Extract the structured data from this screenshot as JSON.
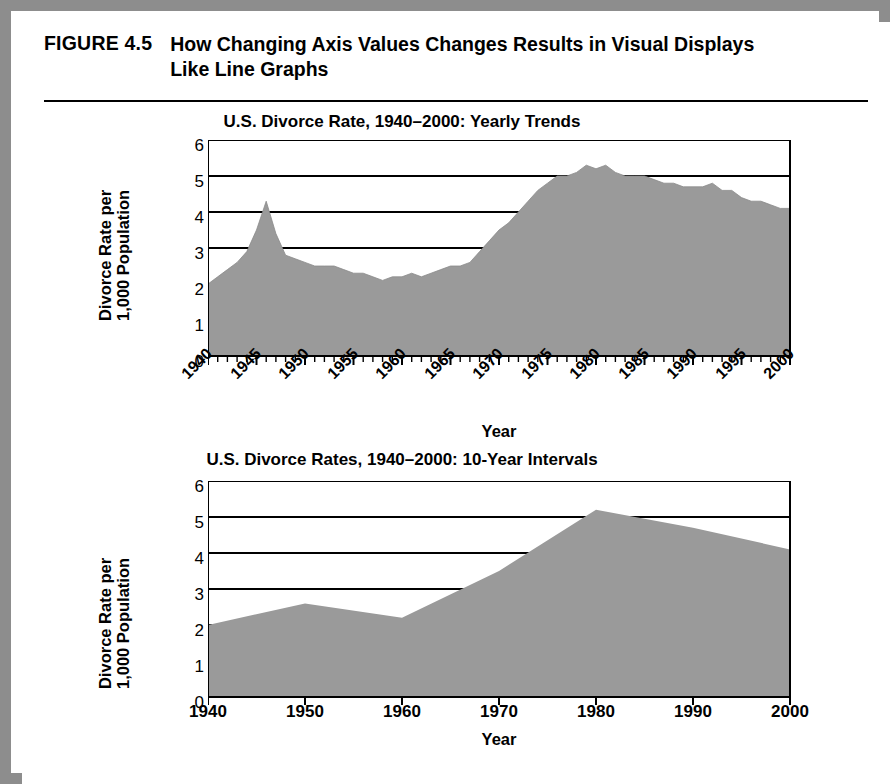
{
  "figure": {
    "number": "FIGURE 4.5",
    "title": "How Changing Axis Values Changes Results in Visual Displays Like Line Graphs"
  },
  "charts": [
    {
      "id": "yearly-trends",
      "title": "U.S. Divorce Rate, 1940–2000: Yearly Trends",
      "ylabel_line1": "Divorce Rate per",
      "ylabel_line2": "1,000 Population",
      "xlabel": "Year",
      "yticks": [
        "6",
        "5",
        "4",
        "3",
        "2",
        "1",
        "0"
      ],
      "xticks": [
        "1940",
        "1945",
        "1950",
        "1955",
        "1960",
        "1965",
        "1970",
        "1975",
        "1980",
        "1985",
        "1990",
        "1995",
        "2000"
      ]
    },
    {
      "id": "ten-year-intervals",
      "title": "U.S. Divorce Rates, 1940–2000: 10-Year Intervals",
      "ylabel_line1": "Divorce Rate per",
      "ylabel_line2": "1,000 Population",
      "xlabel": "Year",
      "yticks": [
        "6",
        "5",
        "4",
        "3",
        "2",
        "1",
        "0"
      ],
      "xticks": [
        "1940",
        "1950",
        "1960",
        "1970",
        "1980",
        "1990",
        "2000"
      ]
    }
  ],
  "colors": {
    "area_fill": "#9a9a9a",
    "axis": "#000000",
    "frame": "#8d8d8d",
    "background": "#ffffff"
  },
  "chart_data": [
    {
      "type": "area",
      "id": "yearly-trends",
      "title": "U.S. Divorce Rate, 1940–2000: Yearly Trends",
      "xlabel": "Year",
      "ylabel": "Divorce Rate per 1,000 Population",
      "xlim": [
        1940,
        2000
      ],
      "ylim": [
        0,
        6
      ],
      "ytick_values": [
        0,
        1,
        2,
        3,
        4,
        5,
        6
      ],
      "xtick_values": [
        1940,
        1945,
        1950,
        1955,
        1960,
        1965,
        1970,
        1975,
        1980,
        1985,
        1990,
        1995,
        2000
      ],
      "minor_xticks_every": 1,
      "grid": "horizontal",
      "legend": "none",
      "x": [
        1940,
        1941,
        1942,
        1943,
        1944,
        1945,
        1946,
        1947,
        1948,
        1949,
        1950,
        1951,
        1952,
        1953,
        1954,
        1955,
        1956,
        1957,
        1958,
        1959,
        1960,
        1961,
        1962,
        1963,
        1964,
        1965,
        1966,
        1967,
        1968,
        1969,
        1970,
        1971,
        1972,
        1973,
        1974,
        1975,
        1976,
        1977,
        1978,
        1979,
        1980,
        1981,
        1982,
        1983,
        1984,
        1985,
        1986,
        1987,
        1988,
        1989,
        1990,
        1991,
        1992,
        1993,
        1994,
        1995,
        1996,
        1997,
        1998,
        1999,
        2000
      ],
      "y": [
        2.0,
        2.2,
        2.4,
        2.6,
        2.9,
        3.5,
        4.3,
        3.4,
        2.8,
        2.7,
        2.6,
        2.5,
        2.5,
        2.5,
        2.4,
        2.3,
        2.3,
        2.2,
        2.1,
        2.2,
        2.2,
        2.3,
        2.2,
        2.3,
        2.4,
        2.5,
        2.5,
        2.6,
        2.9,
        3.2,
        3.5,
        3.7,
        4.0,
        4.3,
        4.6,
        4.8,
        5.0,
        5.0,
        5.1,
        5.3,
        5.2,
        5.3,
        5.1,
        5.0,
        5.0,
        5.0,
        4.9,
        4.8,
        4.8,
        4.7,
        4.7,
        4.7,
        4.8,
        4.6,
        4.6,
        4.4,
        4.3,
        4.3,
        4.2,
        4.1,
        4.1
      ]
    },
    {
      "type": "area",
      "id": "ten-year-intervals",
      "title": "U.S. Divorce Rates, 1940–2000: 10-Year Intervals",
      "xlabel": "Year",
      "ylabel": "Divorce Rate per 1,000 Population",
      "xlim": [
        1940,
        2000
      ],
      "ylim": [
        0,
        6
      ],
      "ytick_values": [
        0,
        1,
        2,
        3,
        4,
        5,
        6
      ],
      "xtick_values": [
        1940,
        1950,
        1960,
        1970,
        1980,
        1990,
        2000
      ],
      "grid": "horizontal",
      "legend": "none",
      "x": [
        1940,
        1950,
        1960,
        1970,
        1980,
        1990,
        2000
      ],
      "y": [
        2.0,
        2.6,
        2.2,
        3.5,
        5.2,
        4.7,
        4.1
      ]
    }
  ]
}
